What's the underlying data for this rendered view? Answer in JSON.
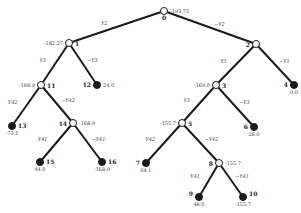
{
  "diagram": {
    "type": "decision-tree",
    "nodes": [
      {
        "id": "0",
        "value": "-193.75",
        "x": 164,
        "y": 11,
        "leaf": false
      },
      {
        "id": "1",
        "value": "-182.27",
        "x": 69,
        "y": 43,
        "leaf": false
      },
      {
        "id": "2",
        "value": "",
        "x": 256,
        "y": 44,
        "leaf": false
      },
      {
        "id": "3",
        "value": "-169.0",
        "x": 216,
        "y": 85,
        "leaf": false
      },
      {
        "id": "4",
        "value": "0.0",
        "x": 294,
        "y": 85,
        "leaf": true
      },
      {
        "id": "5",
        "value": "-155.7",
        "x": 182,
        "y": 123,
        "leaf": false
      },
      {
        "id": "6",
        "value": "28.0",
        "x": 254,
        "y": 127,
        "leaf": true
      },
      {
        "id": "7",
        "value": "64.1",
        "x": 146,
        "y": 163,
        "leaf": true
      },
      {
        "id": "8",
        "value": "-155.7",
        "x": 219,
        "y": 163,
        "leaf": false
      },
      {
        "id": "9",
        "value": "48.0",
        "x": 199,
        "y": 197,
        "leaf": true
      },
      {
        "id": "10",
        "value": "-155.7",
        "x": 243,
        "y": 197,
        "leaf": true
      },
      {
        "id": "11",
        "value": "-168.9",
        "x": 41,
        "y": 85,
        "leaf": false
      },
      {
        "id": "12",
        "value": "24.0",
        "x": 97,
        "y": 85,
        "leaf": true
      },
      {
        "id": "13",
        "value": "-73.1",
        "x": 12,
        "y": 126,
        "leaf": true
      },
      {
        "id": "14",
        "value": "-168.9",
        "x": 73,
        "y": 123,
        "leaf": false
      },
      {
        "id": "15",
        "value": "44.0",
        "x": 40,
        "y": 162,
        "leaf": true
      },
      {
        "id": "16",
        "value": "-168.9",
        "x": 102,
        "y": 162,
        "leaf": true
      }
    ],
    "edges": [
      {
        "from": "0",
        "to": "1",
        "label": "Y2"
      },
      {
        "from": "0",
        "to": "2",
        "label": "~Y2"
      },
      {
        "from": "1",
        "to": "11",
        "label": "Y3"
      },
      {
        "from": "1",
        "to": "12",
        "label": "~Y3"
      },
      {
        "from": "11",
        "to": "13",
        "label": "Y42"
      },
      {
        "from": "11",
        "to": "14",
        "label": "~Y42"
      },
      {
        "from": "14",
        "to": "15",
        "label": "Y41"
      },
      {
        "from": "14",
        "to": "16",
        "label": "~Y41"
      },
      {
        "from": "2",
        "to": "3",
        "label": "Y1"
      },
      {
        "from": "2",
        "to": "4",
        "label": "~Y1"
      },
      {
        "from": "3",
        "to": "5",
        "label": "Y3"
      },
      {
        "from": "3",
        "to": "6",
        "label": "~Y3"
      },
      {
        "from": "5",
        "to": "7",
        "label": "Y42"
      },
      {
        "from": "5",
        "to": "8",
        "label": "~Y42"
      },
      {
        "from": "8",
        "to": "9",
        "label": "Y41"
      },
      {
        "from": "8",
        "to": "10",
        "label": "~Y41"
      }
    ]
  }
}
